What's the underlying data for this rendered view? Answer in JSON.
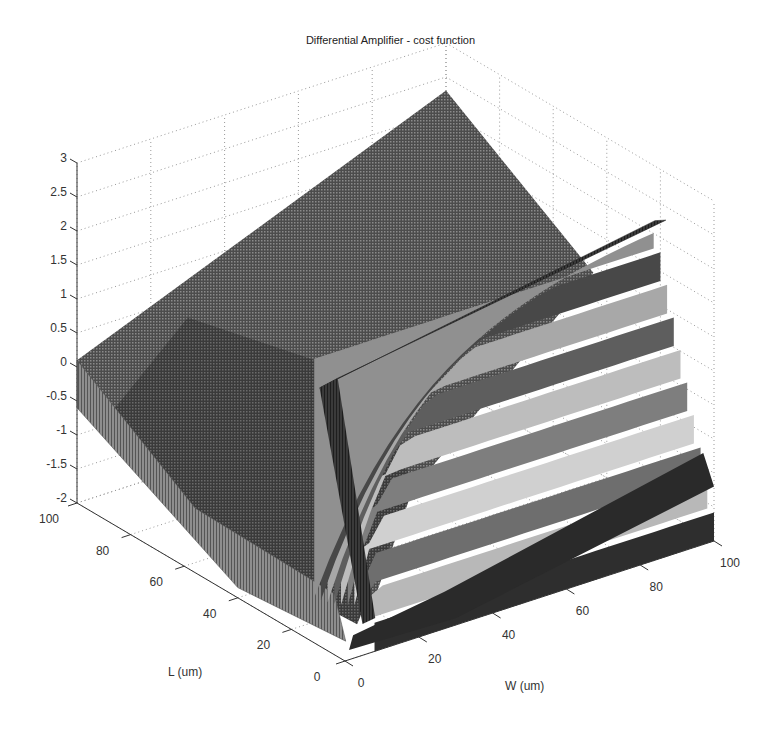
{
  "chart_data": {
    "type": "surface3d",
    "title": "Differential Amplifier - cost function",
    "xlabel": "W (um)",
    "ylabel": "L (um)",
    "zlabel": "",
    "xlim": [
      0,
      100
    ],
    "ylim": [
      0,
      100
    ],
    "zlim": [
      -2,
      3
    ],
    "xticks": [
      0,
      20,
      40,
      60,
      80,
      100
    ],
    "yticks": [
      0,
      20,
      40,
      60,
      80,
      100
    ],
    "zticks": [
      -2,
      -1.5,
      -1,
      -0.5,
      0,
      0.5,
      1,
      1.5,
      2,
      2.5,
      3
    ],
    "zticklabels": [
      "-2",
      "-1.5",
      "-1",
      "-0.5",
      "0",
      "0.5",
      "1",
      "1.5",
      "2",
      "2.5",
      "3"
    ],
    "grid": true,
    "colormap": "gray",
    "samples": [
      {
        "W": 0,
        "L": 100,
        "z": 0.1
      },
      {
        "W": 0,
        "L": 50,
        "z": -1.5
      },
      {
        "W": 5,
        "L": 5,
        "z": -2.0
      },
      {
        "W": 100,
        "L": 100,
        "z": 2.3
      },
      {
        "W": 20,
        "L": 0,
        "z": 1.2
      },
      {
        "W": 100,
        "L": 0,
        "z": 2.2
      },
      {
        "W": 100,
        "L": 30,
        "z": -0.9
      },
      {
        "W": 50,
        "L": 50,
        "z": -0.8
      }
    ]
  },
  "labels": {
    "title": "Differential Amplifier - cost function",
    "xlabel": "W (um)",
    "ylabel": "L (um)",
    "x_ticks": [
      "0",
      "20",
      "40",
      "60",
      "80",
      "100"
    ],
    "y_ticks": [
      "0",
      "20",
      "40",
      "60",
      "80",
      "100"
    ],
    "z_ticks": [
      "-2",
      "-1.5",
      "-1",
      "-0.5",
      "0",
      "0.5",
      "1",
      "1.5",
      "2",
      "2.5",
      "3"
    ]
  }
}
